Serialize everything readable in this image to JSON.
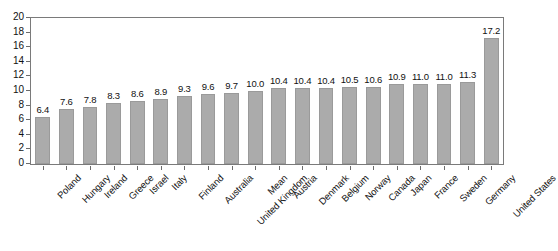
{
  "chart_data": {
    "type": "bar",
    "title": "",
    "subtitle": "",
    "xlabel": "",
    "ylabel": "",
    "ylim": [
      0,
      20
    ],
    "ytick_step": 2,
    "yticks": [
      "0",
      "2",
      "4",
      "6",
      "8",
      "10",
      "12",
      "14",
      "16",
      "18",
      "20"
    ],
    "grid": false,
    "legend": false,
    "legend_position": "none",
    "orientation": "vertical",
    "sorted": "ascending",
    "value_labels_shown": true,
    "categories": [
      "Poland",
      "Hungary",
      "Ireland",
      "Greece",
      "Israel",
      "Italy",
      "Finland",
      "Australia",
      "United Kingdom",
      "Mean",
      "Austria",
      "Denmark",
      "Belgium",
      "Norway",
      "Canada",
      "Japan",
      "France",
      "Sweden",
      "Germany",
      "United States"
    ],
    "values": [
      6.4,
      7.6,
      7.8,
      8.3,
      8.6,
      8.9,
      9.3,
      9.6,
      9.7,
      10.0,
      10.4,
      10.4,
      10.4,
      10.5,
      10.6,
      10.9,
      11.0,
      11.0,
      11.3,
      17.2
    ],
    "value_label_texts": [
      "6.4",
      "7.6",
      "7.8",
      "8.3",
      "8.6",
      "8.9",
      "9.3",
      "9.6",
      "9.7",
      "10.0",
      "10.4",
      "10.4",
      "10.4",
      "10.5",
      "10.6",
      "10.9",
      "11.0",
      "11.0",
      "11.3",
      "17.2"
    ]
  },
  "colors": {
    "bar_fill": "#ababab",
    "bar_stroke": "#9a9a9a",
    "axis": "#7a7a7a",
    "text": "#111111",
    "background": "#ffffff"
  }
}
